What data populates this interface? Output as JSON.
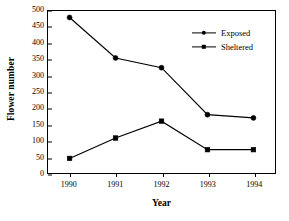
{
  "chart_data": {
    "type": "line",
    "title": "",
    "xlabel": "Year",
    "ylabel": "Flower number",
    "categories": [
      "1990",
      "1991",
      "1992",
      "1993",
      "1994"
    ],
    "x": [
      1990,
      1991,
      1992,
      1993,
      1994
    ],
    "series": [
      {
        "name": "Exposed",
        "marker": "circle",
        "color": "#000000",
        "values": [
          480,
          355,
          325,
          180,
          170
        ]
      },
      {
        "name": "Sheltered",
        "marker": "square",
        "color": "#000000",
        "values": [
          45,
          108,
          160,
          72,
          72
        ]
      }
    ],
    "ylim": [
      0,
      500
    ],
    "yticks": [
      0,
      50,
      100,
      150,
      200,
      250,
      300,
      350,
      400,
      450,
      500
    ],
    "ytick_labels": [
      "0",
      "50",
      "100",
      "150",
      "200",
      "250",
      "300",
      "350",
      "400",
      "450",
      "500"
    ],
    "xtick_labels": [
      "1990",
      "1991",
      "1992",
      "1993",
      "1994"
    ],
    "grid": false,
    "legend_position": "upper right",
    "legend_entries": [
      "Exposed",
      "Sheltered"
    ],
    "frame": "box"
  }
}
